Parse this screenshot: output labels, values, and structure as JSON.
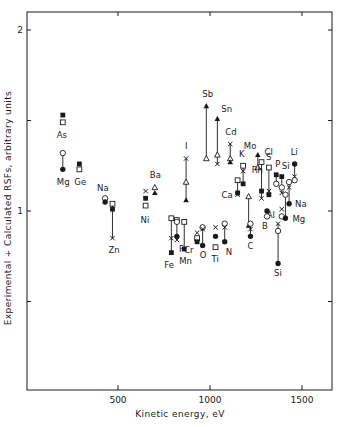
{
  "chart_data": {
    "type": "scatter",
    "title": "",
    "xlabel": "Kinetic energy, eV",
    "ylabel": "Experimental ÷ Calculated RSFs, arbitrary units",
    "xlim": [
      100,
      1700
    ],
    "ylim": [
      0,
      2.1
    ],
    "x_ticks": [
      500,
      1000,
      1500
    ],
    "x_tick_labels": [
      "500",
      "1000",
      "1500"
    ],
    "y_ticks": [
      0.5,
      1,
      1.5,
      2
    ],
    "y_tick_labels": [
      "",
      "1",
      "",
      "2"
    ],
    "grid": false,
    "legend": null,
    "marker_legend": {
      "filled_square": "series A",
      "open_square": "series B",
      "filled_circle": "series C",
      "open_circle": "series D",
      "filled_triangle": "series E",
      "open_triangle": "series F",
      "cross": "series G"
    },
    "points": [
      {
        "element": "As",
        "energy": 200,
        "markers": [
          {
            "shape": "filled_square",
            "y": 1.53
          },
          {
            "shape": "open_square",
            "y": 1.49
          }
        ],
        "label_pos": [
          -6,
          16
        ]
      },
      {
        "element": "Mg",
        "energy": 200,
        "markers": [
          {
            "shape": "open_circle",
            "y": 1.32
          },
          {
            "shape": "filled_circle",
            "y": 1.23
          }
        ],
        "connect": true,
        "label_pos": [
          -6,
          16
        ]
      },
      {
        "element": "Ge",
        "energy": 290,
        "markers": [
          {
            "shape": "filled_square",
            "y": 1.26
          },
          {
            "shape": "open_square",
            "y": 1.23
          }
        ],
        "label_pos": [
          -5,
          16
        ]
      },
      {
        "element": "Na",
        "energy": 430,
        "markers": [
          {
            "shape": "open_circle",
            "y": 1.07
          },
          {
            "shape": "filled_circle",
            "y": 1.05
          }
        ],
        "label_pos": [
          -8,
          -7
        ]
      },
      {
        "element": "Zn",
        "energy": 470,
        "markers": [
          {
            "shape": "open_square",
            "y": 1.04
          },
          {
            "shape": "filled_square",
            "y": 1.01
          },
          {
            "shape": "cross",
            "y": 0.85
          }
        ],
        "connect": true,
        "label_pos": [
          -4,
          15
        ]
      },
      {
        "element": "Ni",
        "energy": 650,
        "markers": [
          {
            "shape": "cross",
            "y": 1.11
          },
          {
            "shape": "filled_square",
            "y": 1.07
          },
          {
            "shape": "open_square",
            "y": 1.03
          }
        ],
        "label_pos": [
          -5,
          17
        ]
      },
      {
        "element": "Ba",
        "energy": 700,
        "markers": [
          {
            "shape": "open_triangle",
            "y": 1.13
          },
          {
            "shape": "filled_triangle",
            "y": 1.1
          }
        ],
        "label_pos": [
          -5,
          -9
        ]
      },
      {
        "element": "I",
        "energy": 870,
        "markers": [
          {
            "shape": "cross",
            "y": 1.29
          },
          {
            "shape": "open_triangle",
            "y": 1.16
          },
          {
            "shape": "filled_triangle",
            "y": 1.06
          }
        ],
        "connect": true,
        "label_pos": [
          -1,
          -10
        ]
      },
      {
        "element": "Sb",
        "energy": 980,
        "markers": [
          {
            "shape": "filled_triangle",
            "y": 1.58
          },
          {
            "shape": "open_triangle",
            "y": 1.29
          }
        ],
        "connect": true,
        "label_pos": [
          -4,
          -9
        ]
      },
      {
        "element": "Sn",
        "energy": 1040,
        "markers": [
          {
            "shape": "filled_triangle",
            "y": 1.51
          },
          {
            "shape": "open_triangle",
            "y": 1.31
          },
          {
            "shape": "cross",
            "y": 1.26
          }
        ],
        "connect": true,
        "label_pos": [
          4,
          -7
        ]
      },
      {
        "element": "Cd",
        "energy": 1110,
        "markers": [
          {
            "shape": "cross",
            "y": 1.37
          },
          {
            "shape": "open_triangle",
            "y": 1.29
          },
          {
            "shape": "filled_triangle",
            "y": 1.27
          }
        ],
        "connect": true,
        "label_pos": [
          -5,
          -9
        ]
      },
      {
        "element": "K",
        "energy": 1180,
        "markers": [
          {
            "shape": "open_square",
            "y": 1.25
          },
          {
            "shape": "cross",
            "y": 1.22
          },
          {
            "shape": "filled_square",
            "y": 1.15
          }
        ],
        "connect": true,
        "label_pos": [
          -4,
          -9
        ]
      },
      {
        "element": "Ca",
        "energy": 1150,
        "markers": [
          {
            "shape": "open_square",
            "y": 1.17
          },
          {
            "shape": "filled_square",
            "y": 1.1
          },
          {
            "shape": "cross",
            "y": 1.09
          }
        ],
        "connect": true,
        "label_pos": [
          -16,
          3
        ]
      },
      {
        "element": "Mo",
        "energy": 1260,
        "markers": [
          {
            "shape": "filled_triangle",
            "y": 1.31
          },
          {
            "shape": "open_triangle",
            "y": 1.24
          }
        ],
        "connect": true,
        "label_pos": [
          -14,
          -6
        ]
      },
      {
        "element": "Cl",
        "energy": 1280,
        "markers": [
          {
            "shape": "open_square",
            "y": 1.27
          },
          {
            "shape": "filled_square",
            "y": 1.11
          },
          {
            "shape": "cross",
            "y": 1.07
          }
        ],
        "connect": true,
        "label_pos": [
          3,
          -7
        ]
      },
      {
        "element": "S",
        "energy": 1320,
        "markers": [
          {
            "shape": "open_square",
            "y": 1.24
          },
          {
            "shape": "cross",
            "y": 1.11
          },
          {
            "shape": "filled_square",
            "y": 1.09
          }
        ],
        "connect": true,
        "label_pos": [
          -3,
          -8
        ]
      },
      {
        "element": "P",
        "energy": 1360,
        "markers": [
          {
            "shape": "filled_square",
            "y": 1.2
          },
          {
            "shape": "open_circle",
            "y": 1.15
          }
        ],
        "connect": true,
        "label_pos": [
          -1,
          -8
        ]
      },
      {
        "element": "Si",
        "energy": 1390,
        "markers": [
          {
            "shape": "filled_square",
            "y": 1.19
          },
          {
            "shape": "open_circle",
            "y": 1.13
          },
          {
            "shape": "cross",
            "y": 1.1
          }
        ],
        "connect": true,
        "label_pos": [
          0,
          -8
        ]
      },
      {
        "element": "Li",
        "energy": 1460,
        "markers": [
          {
            "shape": "filled_circle",
            "y": 1.26
          },
          {
            "shape": "cross",
            "y": 1.19
          },
          {
            "shape": "open_circle",
            "y": 1.17
          }
        ],
        "connect": true,
        "label_pos": [
          -4,
          -9
        ]
      },
      {
        "element": "Na",
        "energy": 1430,
        "markers": [
          {
            "shape": "open_circle",
            "y": 1.16
          },
          {
            "shape": "cross",
            "y": 1.13
          },
          {
            "shape": "filled_circle",
            "y": 1.04
          }
        ],
        "connect": true,
        "label_pos": [
          6,
          3
        ]
      },
      {
        "element": "Rh",
        "energy": 1210,
        "markers": [
          {
            "shape": "open_triangle",
            "y": 1.08
          },
          {
            "shape": "filled_triangle",
            "y": 0.92
          }
        ],
        "connect": true,
        "label_pos": [
          3,
          -24
        ]
      },
      {
        "element": "Al",
        "energy": 1390,
        "markers": [
          {
            "shape": "cross",
            "y": 1.01
          },
          {
            "shape": "open_circle",
            "y": 0.97
          }
        ],
        "label_pos": [
          -15,
          2
        ]
      },
      {
        "element": "Mg",
        "energy": 1410,
        "markers": [
          {
            "shape": "open_circle",
            "y": 1.09
          },
          {
            "shape": "filled_circle",
            "y": 0.96
          }
        ],
        "connect": true,
        "label_pos": [
          7,
          4
        ]
      },
      {
        "element": "B",
        "energy": 1310,
        "markers": [
          {
            "shape": "filled_circle",
            "y": 1.0
          },
          {
            "shape": "open_circle",
            "y": 0.97
          }
        ],
        "label_pos": [
          -5,
          13
        ]
      },
      {
        "element": "C",
        "energy": 1220,
        "markers": [
          {
            "shape": "open_circle",
            "y": 0.93
          },
          {
            "shape": "cross",
            "y": 0.9
          },
          {
            "shape": "filled_circle",
            "y": 0.86
          }
        ],
        "connect": true,
        "label_pos": [
          -3,
          13
        ]
      },
      {
        "element": "Si",
        "energy": 1370,
        "markers": [
          {
            "shape": "cross",
            "y": 0.93
          },
          {
            "shape": "open_circle",
            "y": 0.89
          },
          {
            "shape": "filled_circle",
            "y": 0.71
          }
        ],
        "connect": true,
        "label_pos": [
          -4,
          13
        ]
      },
      {
        "element": "F",
        "energy": 820,
        "markers": [
          {
            "shape": "open_square",
            "y": 0.95
          },
          {
            "shape": "open_circle",
            "y": 0.94
          },
          {
            "shape": "filled_circle",
            "y": 0.86
          },
          {
            "shape": "cross",
            "y": 0.84
          }
        ],
        "connect": true,
        "label_pos": [
          2,
          12
        ]
      },
      {
        "element": "Fe",
        "energy": 790,
        "markers": [
          {
            "shape": "open_square",
            "y": 0.96
          },
          {
            "shape": "cross",
            "y": 0.85
          },
          {
            "shape": "filled_square",
            "y": 0.77
          }
        ],
        "connect": true,
        "label_pos": [
          -7,
          15
        ]
      },
      {
        "element": "Mn",
        "energy": 860,
        "markers": [
          {
            "shape": "open_square",
            "y": 0.94
          },
          {
            "shape": "filled_square",
            "y": 0.79
          }
        ],
        "connect": true,
        "label_pos": [
          -5,
          15
        ]
      },
      {
        "element": "Cr",
        "energy": 930,
        "markers": [
          {
            "shape": "cross",
            "y": 0.88
          },
          {
            "shape": "open_square",
            "y": 0.85
          },
          {
            "shape": "filled_square",
            "y": 0.83
          }
        ],
        "label_pos": [
          -13,
          11
        ]
      },
      {
        "element": "O",
        "energy": 960,
        "markers": [
          {
            "shape": "open_circle",
            "y": 0.91
          },
          {
            "shape": "cross",
            "y": 0.9
          },
          {
            "shape": "filled_circle",
            "y": 0.81
          }
        ],
        "connect": true,
        "label_pos": [
          -3,
          13
        ]
      },
      {
        "element": "Ti",
        "energy": 1030,
        "markers": [
          {
            "shape": "cross",
            "y": 0.91
          },
          {
            "shape": "filled_circle",
            "y": 0.86
          },
          {
            "shape": "open_square",
            "y": 0.8
          }
        ],
        "label_pos": [
          -4,
          15
        ]
      },
      {
        "element": "N",
        "energy": 1080,
        "markers": [
          {
            "shape": "open_circle",
            "y": 0.93
          },
          {
            "shape": "cross",
            "y": 0.91
          },
          {
            "shape": "filled_circle",
            "y": 0.83
          }
        ],
        "connect": true,
        "label_pos": [
          1,
          13
        ]
      }
    ]
  }
}
